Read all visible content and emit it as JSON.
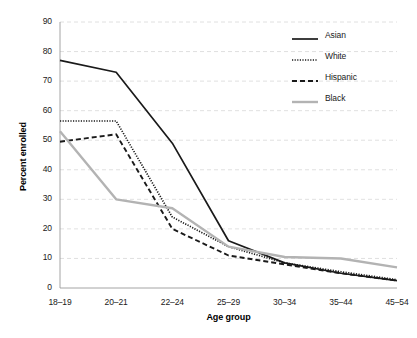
{
  "chart_data": {
    "type": "line",
    "title": "",
    "xlabel": "Age group",
    "ylabel": "Percent enrolled",
    "categories": [
      "18–19",
      "20–21",
      "22–24",
      "25–29",
      "30–34",
      "35–44",
      "45–54"
    ],
    "ylim": [
      0,
      90
    ],
    "yticks": [
      0,
      10,
      20,
      30,
      40,
      50,
      60,
      70,
      80,
      90
    ],
    "grid": true,
    "legend_position": "top-right",
    "series": [
      {
        "name": "Asian",
        "style": "solid",
        "color": "#1a1a1a",
        "values": [
          77,
          73,
          49,
          16,
          8.5,
          5,
          2.5
        ]
      },
      {
        "name": "White",
        "style": "dotted",
        "color": "#1a1a1a",
        "values": [
          56.5,
          56.5,
          24,
          14,
          8.5,
          5.5,
          2.8
        ]
      },
      {
        "name": "Hispanic",
        "style": "dashed",
        "color": "#1a1a1a",
        "values": [
          49.5,
          52,
          20,
          11,
          8,
          5,
          2.5
        ]
      },
      {
        "name": "Black",
        "style": "solid",
        "color": "#b3b3b3",
        "values": [
          53,
          30,
          27,
          14,
          10.5,
          10,
          7
        ]
      }
    ]
  },
  "legend": {
    "items": [
      {
        "label": "Asian",
        "swatch": "legend-line-solid-dark"
      },
      {
        "label": "White",
        "swatch": "legend-line-dotted-dark"
      },
      {
        "label": "Hispanic",
        "swatch": "legend-line-dashed-dark"
      },
      {
        "label": "Black",
        "swatch": "legend-line-solid-gray"
      }
    ]
  },
  "axes": {
    "y_tick_labels": [
      "90",
      "80",
      "70",
      "60",
      "50",
      "40",
      "30",
      "20",
      "10",
      "0"
    ],
    "x_tick_labels": [
      "18–19",
      "20–21",
      "22–24",
      "25–29",
      "30–34",
      "35–44",
      "45–54"
    ],
    "y_title": "Percent enrolled",
    "x_title": "Age group"
  },
  "colors": {
    "dark_line": "#1a1a1a",
    "gray_line": "#b3b3b3",
    "grid": "#d8d8d8",
    "axis": "#9a9a9a",
    "background": "#ffffff"
  }
}
